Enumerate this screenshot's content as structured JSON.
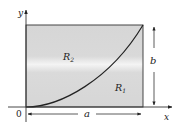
{
  "diagram": {
    "type": "region-under-curve",
    "axes": {
      "x_label": "x",
      "y_label": "y",
      "origin_label": "0"
    },
    "rectangle": {
      "width_label": "a",
      "height_label": "b",
      "fill": "#d9d9d9"
    },
    "regions": [
      {
        "label": "R",
        "subscript": "2",
        "position": "above-curve"
      },
      {
        "label": "R",
        "subscript": "1",
        "position": "below-curve"
      }
    ],
    "curve": {
      "description": "increasing concave-up curve from origin to top-right corner (a, b)"
    },
    "colors": {
      "stroke": "#222222",
      "fill": "#d9d9d9",
      "highlight": "#f2f2f2"
    }
  }
}
